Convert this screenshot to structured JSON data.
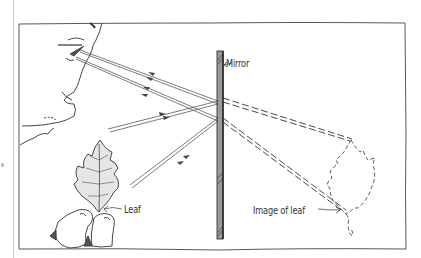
{
  "figure": {
    "type": "illustration",
    "labels": {
      "mirror": "Mirror",
      "leaf": "Leaf",
      "image": "Image of leaf"
    },
    "elements": {
      "observer": "face-profile",
      "object": "leaf-held-in-hand",
      "mirror": "vertical-plane-mirror",
      "virtual_image": "dashed-leaf-outline"
    },
    "rays": {
      "real_count": 4,
      "style_real": "solid-with-arrows",
      "style_virtual": "dashed-extension"
    },
    "colors": {
      "ink": "#333333",
      "mirror_fill": "#9a9a9a",
      "leaf_fill": "#e6e6e6",
      "paper": "#ffffff"
    }
  }
}
